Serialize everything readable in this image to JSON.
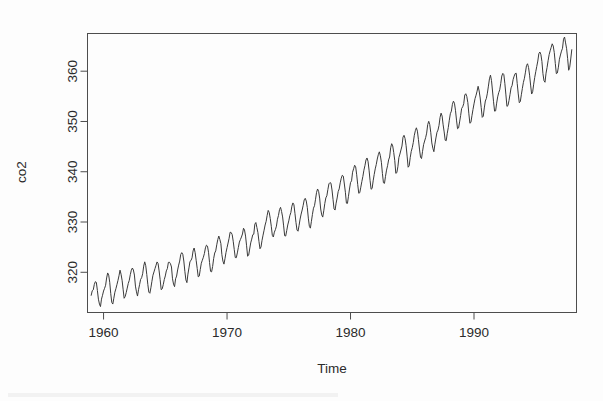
{
  "figure": {
    "width": 603,
    "height": 401,
    "background_color": "#fdfdfd",
    "line_color": "#3a3a3a",
    "axis_color": "#4d4d4d"
  },
  "chart_data": {
    "type": "line",
    "title": "",
    "subtitle": "",
    "xlabel": "Time",
    "ylabel": "co2",
    "grid": false,
    "legend": "none",
    "xlim": [
      1958.7,
      1998.3
    ],
    "ylim": [
      312.0,
      367.5
    ],
    "xticks": [
      1960,
      1970,
      1980,
      1990
    ],
    "xtick_labels": [
      "1960",
      "1970",
      "1980",
      "1990"
    ],
    "yticks": [
      320,
      330,
      340,
      350,
      360
    ],
    "ytick_labels": [
      "320",
      "330",
      "340",
      "350",
      "360"
    ],
    "series": [
      {
        "name": "co2",
        "units": "ppm",
        "frequency": "monthly",
        "x_start": 1959.0,
        "x_end": 1997.917,
        "x_step": 0.0833333,
        "values": [
          315.42,
          316.31,
          316.5,
          317.56,
          318.13,
          318.0,
          316.39,
          314.65,
          313.68,
          313.18,
          314.66,
          315.43,
          316.27,
          316.81,
          317.42,
          318.87,
          319.87,
          319.43,
          318.01,
          315.74,
          314.0,
          313.68,
          314.84,
          316.03,
          316.73,
          317.54,
          318.38,
          319.31,
          320.42,
          319.61,
          318.42,
          316.63,
          314.83,
          315.16,
          315.94,
          316.85,
          317.78,
          318.4,
          319.53,
          320.42,
          320.85,
          320.45,
          319.45,
          317.25,
          316.11,
          315.27,
          316.53,
          317.53,
          318.58,
          318.92,
          319.7,
          321.22,
          322.08,
          321.31,
          319.58,
          317.61,
          316.05,
          315.83,
          316.91,
          318.2,
          319.41,
          320.07,
          320.74,
          321.4,
          322.06,
          321.73,
          320.27,
          318.54,
          316.54,
          316.71,
          317.53,
          318.55,
          319.27,
          320.28,
          320.73,
          321.97,
          322.0,
          321.71,
          321.05,
          318.71,
          317.66,
          317.14,
          318.7,
          319.25,
          320.46,
          321.43,
          322.23,
          323.54,
          323.91,
          323.59,
          322.24,
          320.2,
          318.48,
          317.94,
          319.63,
          320.87,
          322.17,
          322.34,
          322.88,
          324.25,
          324.83,
          323.93,
          322.38,
          320.76,
          319.1,
          319.24,
          320.56,
          321.8,
          322.4,
          322.99,
          323.73,
          324.86,
          325.4,
          325.2,
          323.98,
          321.95,
          320.18,
          320.09,
          321.16,
          322.74,
          323.83,
          324.26,
          325.47,
          326.5,
          327.21,
          326.54,
          325.72,
          323.5,
          322.22,
          321.62,
          322.69,
          323.95,
          324.89,
          325.82,
          326.77,
          327.97,
          327.91,
          327.5,
          326.18,
          324.53,
          322.93,
          322.9,
          323.85,
          324.96,
          326.01,
          326.51,
          327.01,
          327.62,
          328.76,
          328.4,
          327.2,
          325.27,
          323.2,
          323.4,
          324.63,
          325.85,
          326.6,
          327.47,
          327.58,
          329.56,
          329.9,
          328.92,
          327.88,
          326.16,
          324.68,
          325.04,
          326.34,
          327.39,
          328.37,
          329.4,
          330.14,
          331.33,
          332.31,
          331.9,
          330.7,
          329.15,
          327.35,
          327.02,
          327.99,
          328.48,
          329.18,
          330.55,
          331.32,
          332.48,
          332.92,
          332.08,
          331.01,
          329.23,
          327.27,
          327.21,
          328.29,
          329.41,
          330.23,
          331.25,
          331.87,
          333.14,
          333.8,
          333.43,
          331.73,
          329.9,
          328.4,
          328.17,
          329.32,
          330.59,
          331.58,
          332.39,
          333.33,
          334.41,
          334.71,
          334.17,
          332.89,
          330.77,
          329.14,
          328.78,
          330.14,
          331.52,
          332.75,
          333.24,
          334.53,
          335.9,
          336.57,
          336.1,
          334.76,
          332.59,
          331.42,
          330.98,
          332.24,
          333.68,
          334.8,
          335.22,
          336.47,
          337.59,
          337.84,
          337.72,
          336.37,
          334.51,
          332.6,
          332.38,
          333.75,
          334.78,
          336.05,
          336.59,
          337.79,
          338.71,
          339.3,
          339.12,
          337.56,
          335.92,
          333.75,
          333.7,
          335.12,
          336.56,
          337.84,
          338.19,
          339.91,
          340.6,
          341.29,
          341.0,
          339.39,
          337.43,
          335.72,
          335.84,
          336.93,
          338.04,
          339.06,
          340.3,
          341.21,
          342.33,
          342.74,
          342.08,
          340.32,
          338.26,
          336.52,
          336.68,
          338.19,
          339.44,
          340.57,
          341.44,
          342.53,
          343.39,
          343.96,
          343.18,
          341.88,
          339.65,
          337.81,
          337.69,
          339.09,
          340.32,
          341.2,
          342.35,
          342.93,
          344.77,
          345.58,
          345.14,
          343.81,
          342.21,
          339.69,
          339.82,
          340.98,
          342.82,
          343.52,
          344.33,
          345.11,
          346.88,
          347.25,
          346.62,
          345.22,
          343.11,
          340.9,
          341.18,
          342.8,
          344.04,
          344.79,
          345.82,
          347.25,
          348.17,
          348.74,
          348.07,
          346.38,
          344.51,
          342.92,
          342.62,
          344.06,
          345.38,
          346.11,
          346.78,
          347.68,
          349.37,
          350.03,
          349.37,
          347.76,
          345.73,
          344.68,
          343.99,
          345.48,
          346.72,
          347.84,
          348.29,
          349.23,
          350.8,
          351.66,
          351.07,
          349.33,
          347.92,
          346.27,
          346.18,
          347.64,
          348.78,
          350.25,
          351.54,
          352.05,
          353.41,
          354.04,
          353.62,
          352.22,
          350.27,
          348.55,
          348.72,
          349.91,
          351.18,
          352.6,
          352.92,
          353.53,
          355.26,
          355.52,
          354.97,
          353.75,
          351.52,
          349.64,
          349.83,
          351.14,
          352.37,
          353.5,
          354.55,
          355.23,
          356.04,
          357.0,
          356.07,
          354.67,
          352.76,
          350.82,
          351.04,
          352.69,
          354.07,
          354.59,
          355.63,
          357.03,
          358.48,
          359.22,
          358.12,
          356.06,
          353.92,
          352.05,
          352.11,
          353.64,
          354.89,
          355.73,
          356.3,
          357.57,
          359.04,
          359.57,
          359.31,
          357.51,
          355.28,
          353.0,
          353.17,
          354.16,
          355.4,
          356.69,
          357.15,
          358.35,
          359.02,
          359.52,
          359.6,
          357.53,
          355.48,
          353.73,
          353.95,
          355.31,
          356.58,
          357.78,
          358.6,
          359.81,
          361.13,
          361.48,
          360.74,
          359.21,
          357.24,
          355.46,
          355.91,
          357.42,
          358.77,
          359.9,
          360.96,
          362.02,
          363.48,
          363.82,
          363.3,
          361.94,
          359.5,
          358.11,
          357.8,
          359.61,
          360.74,
          362.09,
          363.29,
          364.06,
          364.76,
          365.45,
          365.01,
          363.7,
          361.54,
          359.51,
          359.65,
          360.8,
          362.38,
          363.23,
          363.99,
          364.56,
          366.36,
          366.8,
          365.63,
          364.47,
          362.5,
          360.19,
          360.78,
          362.43,
          364.28
        ]
      }
    ]
  },
  "axes": {
    "x_axis_label": "Time",
    "y_axis_label": "co2"
  }
}
